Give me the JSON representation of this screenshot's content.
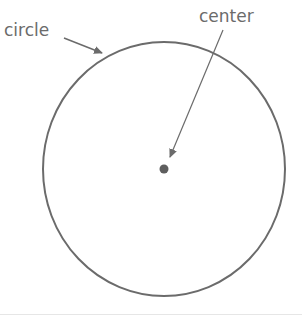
{
  "diagram": {
    "labels": {
      "circle": "circle",
      "center": "center"
    },
    "colors": {
      "stroke": "#6b6b6b",
      "text": "#6b6b6b",
      "background": "#ffffff"
    },
    "shapes": {
      "circle": {
        "cx": 164,
        "cy": 169,
        "rx": 121,
        "ry": 127
      },
      "center_point": {
        "cx": 164,
        "cy": 169,
        "r": 4
      }
    }
  }
}
